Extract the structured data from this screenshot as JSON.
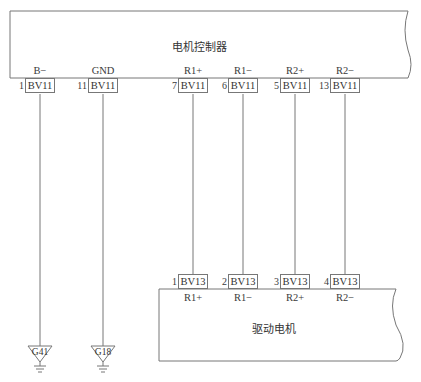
{
  "diagram": {
    "controller": {
      "title": "电机控制器",
      "pins": [
        {
          "pin": "1",
          "connector": "BV11",
          "signal": "B−"
        },
        {
          "pin": "11",
          "connector": "BV11",
          "signal": "GND"
        },
        {
          "pin": "7",
          "connector": "BV11",
          "signal": "R1+"
        },
        {
          "pin": "6",
          "connector": "BV11",
          "signal": "R1−"
        },
        {
          "pin": "5",
          "connector": "BV11",
          "signal": "R2+"
        },
        {
          "pin": "13",
          "connector": "BV11",
          "signal": "R2−"
        }
      ]
    },
    "motor": {
      "title": "驱动电机",
      "pins": [
        {
          "pin": "1",
          "connector": "BV13",
          "signal": "R1+"
        },
        {
          "pin": "2",
          "connector": "BV13",
          "signal": "R1−"
        },
        {
          "pin": "3",
          "connector": "BV13",
          "signal": "R2+"
        },
        {
          "pin": "4",
          "connector": "BV13",
          "signal": "R2−"
        }
      ]
    },
    "grounds": [
      {
        "label": "G41",
        "from_pin": "1"
      },
      {
        "label": "G18",
        "from_pin": "11"
      }
    ],
    "colors": {
      "line": "#777777",
      "background": "#ffffff"
    }
  }
}
